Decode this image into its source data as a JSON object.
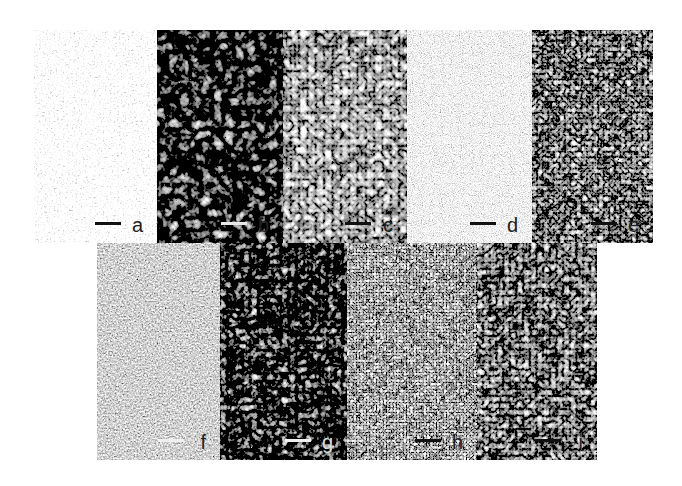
{
  "figure": {
    "panels": [
      {
        "id": "a",
        "label": "a",
        "x": 34,
        "y": 30,
        "w": 123,
        "h": 213,
        "tone": "light",
        "base": "#d8d8d8",
        "spot": "#1a1a1a",
        "label_color": "#222222",
        "bar_color": "#111111",
        "freq": 0.55,
        "cells": false
      },
      {
        "id": "b",
        "label": "b",
        "x": 157,
        "y": 30,
        "w": 126,
        "h": 213,
        "tone": "dark",
        "base": "#3a3a3a",
        "spot": "#111111",
        "label_color": "#222222",
        "bar_color": "#e8e8e8",
        "freq": 0.09,
        "cells": true
      },
      {
        "id": "c",
        "label": "c",
        "x": 283,
        "y": 30,
        "w": 124,
        "h": 213,
        "tone": "light",
        "base": "#dcdcdc",
        "spot": "#333333",
        "label_color": "#222222",
        "bar_color": "#111111",
        "freq": 0.12,
        "cells": true
      },
      {
        "id": "d",
        "label": "d",
        "x": 407,
        "y": 30,
        "w": 125,
        "h": 213,
        "tone": "mid-gray",
        "base": "#b8b8b8",
        "spot": "#8a8a8a",
        "label_color": "#222222",
        "bar_color": "#111111",
        "freq": 0.9,
        "cells": false
      },
      {
        "id": "e",
        "label": "e",
        "x": 532,
        "y": 30,
        "w": 121,
        "h": 213,
        "tone": "gray",
        "base": "#9a9a9a",
        "spot": "#555555",
        "label_color": "#222222",
        "bar_color": "#111111",
        "freq": 0.18,
        "cells": true
      },
      {
        "id": "f",
        "label": "f",
        "x": 97,
        "y": 243,
        "w": 123,
        "h": 217,
        "tone": "dark-noise",
        "base": "#555555",
        "spot": "#222222",
        "label_color": "#222222",
        "bar_color": "#f0f0f0",
        "freq": 0.6,
        "cells": false
      },
      {
        "id": "g",
        "label": "g",
        "x": 220,
        "y": 243,
        "w": 127,
        "h": 217,
        "tone": "dark",
        "base": "#3c3c3c",
        "spot": "#1a1a1a",
        "label_color": "#dddddd",
        "bar_color": "#f0f0f0",
        "freq": 0.13,
        "cells": true
      },
      {
        "id": "h",
        "label": "h",
        "x": 347,
        "y": 243,
        "w": 130,
        "h": 217,
        "tone": "light-fine",
        "base": "#b0b0b0",
        "spot": "#444444",
        "label_color": "#222222",
        "bar_color": "#111111",
        "freq": 0.3,
        "cells": true
      },
      {
        "id": "i",
        "label": "i",
        "x": 477,
        "y": 243,
        "w": 120,
        "h": 217,
        "tone": "gray",
        "base": "#7a7a7a",
        "spot": "#222222",
        "label_color": "#222222",
        "bar_color": "#111111",
        "freq": 0.15,
        "cells": true
      }
    ]
  }
}
